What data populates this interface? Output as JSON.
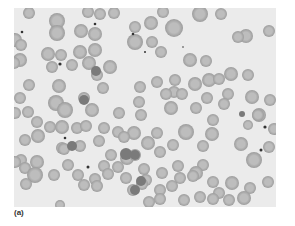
{
  "figure": {
    "label": "(a)",
    "colors": {
      "background": "#ebebeb",
      "cell_rim": "#9c9c9c",
      "cell_center": "#bdbdbd",
      "dark_cell": "#7a7a7a",
      "dot": "#333333"
    },
    "cells": [
      [
        29,
        13,
        6
      ],
      [
        57,
        21,
        8
      ],
      [
        88,
        12,
        6
      ],
      [
        100,
        14,
        6
      ],
      [
        114,
        13,
        6
      ],
      [
        163,
        12,
        6
      ],
      [
        200,
        14,
        8
      ],
      [
        221,
        14,
        6
      ],
      [
        15,
        40,
        7
      ],
      [
        57,
        33,
        8
      ],
      [
        81,
        31,
        7
      ],
      [
        95,
        34,
        7
      ],
      [
        135,
        27,
        6
      ],
      [
        151,
        23,
        7
      ],
      [
        174,
        28,
        9
      ],
      [
        246,
        36,
        7
      ],
      [
        269,
        31,
        6
      ],
      [
        21,
        45,
        6
      ],
      [
        48,
        54,
        7
      ],
      [
        61,
        55,
        6
      ],
      [
        80,
        52,
        7
      ],
      [
        95,
        50,
        7
      ],
      [
        135,
        42,
        8
      ],
      [
        152,
        42,
        6
      ],
      [
        161,
        52,
        6
      ],
      [
        238,
        37,
        6
      ],
      [
        20,
        60,
        7
      ],
      [
        14,
        63,
        6
      ],
      [
        52,
        67,
        6
      ],
      [
        72,
        65,
        6
      ],
      [
        89,
        63,
        7
      ],
      [
        110,
        67,
        7
      ],
      [
        190,
        60,
        7
      ],
      [
        206,
        61,
        6
      ],
      [
        29,
        85,
        6
      ],
      [
        59,
        86,
        7
      ],
      [
        97,
        75,
        6
      ],
      [
        140,
        87,
        6
      ],
      [
        157,
        82,
        6
      ],
      [
        175,
        80,
        6
      ],
      [
        174,
        92,
        6
      ],
      [
        195,
        84,
        7
      ],
      [
        209,
        80,
        7
      ],
      [
        219,
        79,
        6
      ],
      [
        231,
        74,
        7
      ],
      [
        248,
        75,
        6
      ],
      [
        103,
        88,
        6
      ],
      [
        20,
        98,
        6
      ],
      [
        84,
        98,
        6
      ],
      [
        166,
        94,
        6
      ],
      [
        182,
        94,
        6
      ],
      [
        207,
        98,
        6
      ],
      [
        228,
        94,
        6
      ],
      [
        252,
        97,
        7
      ],
      [
        28,
        112,
        6
      ],
      [
        56,
        103,
        8
      ],
      [
        65,
        110,
        8
      ],
      [
        92,
        110,
        7
      ],
      [
        139,
        102,
        6
      ],
      [
        171,
        108,
        7
      ],
      [
        196,
        108,
        6
      ],
      [
        224,
        104,
        6
      ],
      [
        259,
        115,
        7
      ],
      [
        270,
        100,
        6
      ],
      [
        15,
        113,
        6
      ],
      [
        119,
        113,
        6
      ],
      [
        141,
        115,
        6
      ],
      [
        213,
        120,
        6
      ],
      [
        258,
        115,
        6
      ],
      [
        37,
        122,
        6
      ],
      [
        50,
        127,
        6
      ],
      [
        62,
        127,
        7
      ],
      [
        77,
        128,
        6
      ],
      [
        86,
        126,
        6
      ],
      [
        104,
        128,
        6
      ],
      [
        118,
        132,
        6
      ],
      [
        134,
        133,
        7
      ],
      [
        157,
        133,
        6
      ],
      [
        186,
        132,
        8
      ],
      [
        212,
        134,
        7
      ],
      [
        248,
        125,
        5
      ],
      [
        274,
        129,
        6
      ],
      [
        25,
        140,
        6
      ],
      [
        38,
        136,
        7
      ],
      [
        62,
        148,
        6
      ],
      [
        80,
        146,
        6
      ],
      [
        99,
        141,
        6
      ],
      [
        124,
        137,
        6
      ],
      [
        148,
        143,
        7
      ],
      [
        173,
        145,
        6
      ],
      [
        203,
        146,
        6
      ],
      [
        241,
        144,
        7
      ],
      [
        269,
        147,
        6
      ],
      [
        21,
        160,
        6
      ],
      [
        37,
        162,
        7
      ],
      [
        64,
        149,
        6
      ],
      [
        111,
        155,
        6
      ],
      [
        127,
        158,
        7
      ],
      [
        135,
        155,
        6
      ],
      [
        160,
        152,
        6
      ],
      [
        203,
        165,
        6
      ],
      [
        254,
        160,
        8
      ],
      [
        15,
        162,
        6
      ],
      [
        25,
        168,
        6
      ],
      [
        35,
        175,
        8
      ],
      [
        68,
        165,
        6
      ],
      [
        104,
        166,
        6
      ],
      [
        118,
        167,
        6
      ],
      [
        144,
        169,
        6
      ],
      [
        178,
        166,
        6
      ],
      [
        196,
        173,
        7
      ],
      [
        26,
        184,
        6
      ],
      [
        54,
        175,
        6
      ],
      [
        78,
        175,
        6
      ],
      [
        95,
        179,
        6
      ],
      [
        108,
        174,
        6
      ],
      [
        126,
        178,
        6
      ],
      [
        146,
        180,
        6
      ],
      [
        162,
        173,
        6
      ],
      [
        180,
        178,
        6
      ],
      [
        193,
        176,
        6
      ],
      [
        213,
        182,
        6
      ],
      [
        232,
        183,
        7
      ],
      [
        250,
        188,
        6
      ],
      [
        268,
        182,
        6
      ],
      [
        84,
        185,
        6
      ],
      [
        97,
        186,
        6
      ],
      [
        142,
        184,
        6
      ],
      [
        133,
        190,
        6
      ],
      [
        160,
        190,
        6
      ],
      [
        172,
        186,
        6
      ],
      [
        219,
        193,
        6
      ],
      [
        149,
        202,
        6
      ],
      [
        160,
        199,
        6
      ],
      [
        184,
        200,
        6
      ],
      [
        200,
        197,
        6
      ],
      [
        213,
        199,
        6
      ],
      [
        229,
        200,
        6
      ],
      [
        244,
        198,
        7
      ],
      [
        60,
        205,
        5
      ]
    ],
    "dark_cells": [
      [
        242,
        114,
        3
      ],
      [
        141,
        181,
        5
      ],
      [
        135,
        190,
        5
      ],
      [
        126,
        154,
        6
      ],
      [
        135,
        155,
        5
      ],
      [
        84,
        100,
        5
      ],
      [
        72,
        146,
        5
      ],
      [
        96,
        71,
        5
      ]
    ],
    "dots": [
      [
        22,
        32,
        1.3
      ],
      [
        95,
        24,
        1.3
      ],
      [
        133,
        34,
        1.3
      ],
      [
        60,
        64,
        1.6
      ],
      [
        145,
        52,
        1
      ],
      [
        65,
        138,
        1.3
      ],
      [
        88,
        167,
        1.5
      ],
      [
        265,
        127,
        1.6
      ],
      [
        261,
        150,
        1.5
      ],
      [
        183,
        47,
        0.8
      ]
    ]
  }
}
